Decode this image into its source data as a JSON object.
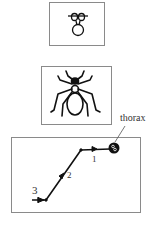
{
  "panels": [
    {
      "id": "small-spider-panel",
      "icon": "small-spider-icon"
    },
    {
      "id": "large-spider-panel",
      "icon": "large-spider-icon"
    },
    {
      "id": "path-panel",
      "icon": "movement-path"
    }
  ],
  "path": {
    "labels": {
      "step1": "1",
      "step2": "2",
      "step3": "3"
    },
    "callout": "thorax"
  },
  "colors": {
    "ink": "#111111",
    "border": "#8a8a8a",
    "text": "#333333"
  }
}
